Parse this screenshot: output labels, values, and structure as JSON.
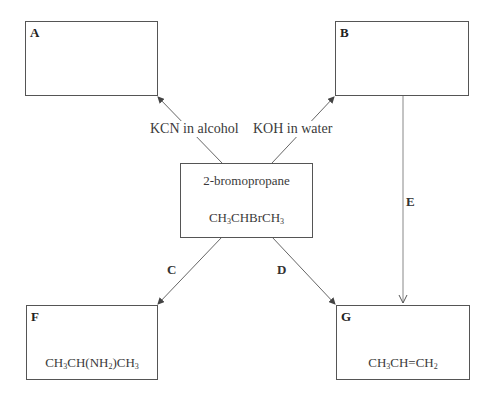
{
  "diagram": {
    "type": "reaction-scheme",
    "boxes": {
      "A": {
        "label": "A",
        "formula": ""
      },
      "B": {
        "label": "B",
        "formula": ""
      },
      "start": {
        "name": "2-bromopropane",
        "formula_parts": [
          "CH",
          "3",
          "CHBrCH",
          "3"
        ]
      },
      "F": {
        "label": "F",
        "formula_parts": [
          "CH",
          "3",
          "CH(NH",
          "2",
          ")CH",
          "3"
        ]
      },
      "G": {
        "label": "G",
        "formula_parts": [
          "CH",
          "3",
          "CH=CH",
          "2"
        ]
      }
    },
    "reagents": {
      "to_A": "KCN in alcohol",
      "to_B": "KOH in water"
    },
    "steps": {
      "C": "C",
      "D": "D",
      "E": "E"
    },
    "edges": [
      {
        "from": "2-bromopropane",
        "to": "A",
        "label": "KCN in alcohol"
      },
      {
        "from": "2-bromopropane",
        "to": "B",
        "label": "KOH in water"
      },
      {
        "from": "2-bromopropane",
        "to": "F",
        "label": "C"
      },
      {
        "from": "2-bromopropane",
        "to": "G",
        "label": "D"
      },
      {
        "from": "B",
        "to": "G",
        "label": "E"
      }
    ]
  }
}
